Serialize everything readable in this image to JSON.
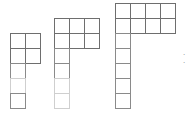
{
  "diagram": {
    "type": "growing-square-pattern",
    "cell_size": 15,
    "stroke_color": "#8a8a8a",
    "strong_stroke_color": "#6e6e6e",
    "figures": [
      {
        "index": 1,
        "top_block": {
          "cols": 2,
          "rows": 2,
          "x": 10,
          "y": 33
        },
        "column": {
          "x": 10,
          "y": 63,
          "cells": 3,
          "faint_lines": [
            78
          ]
        }
      },
      {
        "index": 2,
        "top_block": {
          "cols": 3,
          "rows": 2,
          "x": 54,
          "y": 18
        },
        "column": {
          "x": 54,
          "y": 48,
          "cells": 4,
          "faint_lines": [
            78,
            93
          ]
        }
      },
      {
        "index": 3,
        "top_block": {
          "cols": 4,
          "rows": 2,
          "x": 115,
          "y": 3
        },
        "column": {
          "x": 115,
          "y": 33,
          "cells": 5,
          "faint_lines": []
        }
      }
    ],
    "continuation": "· ·"
  }
}
